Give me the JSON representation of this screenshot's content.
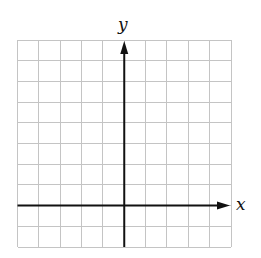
{
  "diagram": {
    "type": "cartesian-coordinate-grid",
    "axes": {
      "x_label": "x",
      "y_label": "y"
    },
    "grid": {
      "columns": 10,
      "rows": 10,
      "y_axis_column_index": 5,
      "x_axis_row_index": 8,
      "line_color": "#c4c4c4",
      "axis_color": "#111111"
    },
    "layout": {
      "left": 17.5,
      "right": 231,
      "top": 40,
      "bottom": 247
    }
  }
}
